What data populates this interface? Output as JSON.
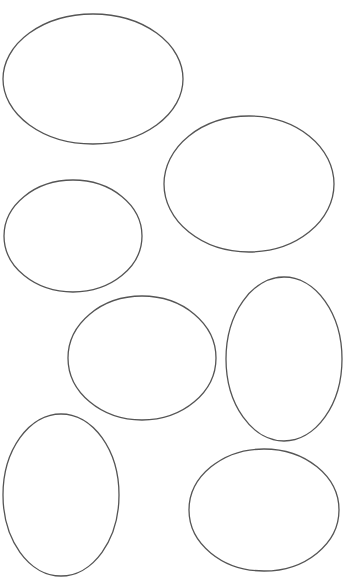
{
  "canvas": {
    "width": 345,
    "height": 577,
    "background": "#ffffff",
    "stroke_color": "#555555"
  },
  "shapes": [
    {
      "type": "ellipse",
      "cx": 93,
      "cy": 79,
      "rx": 90,
      "ry": 65
    },
    {
      "type": "ellipse",
      "cx": 249,
      "cy": 184,
      "rx": 85,
      "ry": 68
    },
    {
      "type": "ellipse",
      "cx": 73,
      "cy": 236,
      "rx": 69,
      "ry": 56
    },
    {
      "type": "ellipse",
      "cx": 142,
      "cy": 358,
      "rx": 74,
      "ry": 62
    },
    {
      "type": "ellipse",
      "cx": 284,
      "cy": 359,
      "rx": 58,
      "ry": 82
    },
    {
      "type": "ellipse",
      "cx": 61,
      "cy": 495,
      "rx": 58,
      "ry": 81
    },
    {
      "type": "ellipse",
      "cx": 264,
      "cy": 510,
      "rx": 75,
      "ry": 61
    }
  ]
}
